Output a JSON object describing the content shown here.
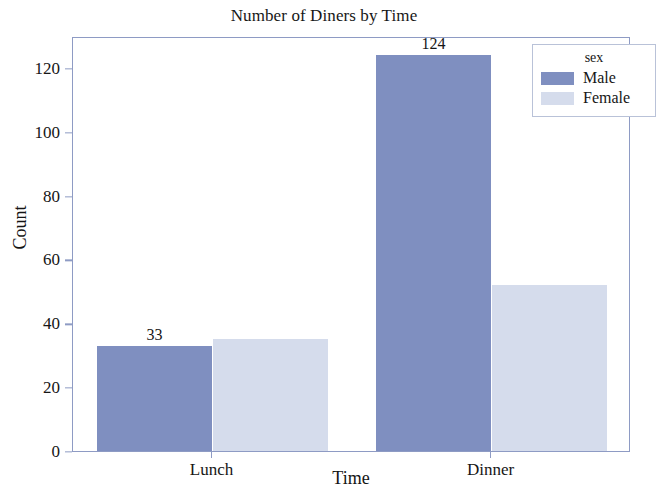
{
  "chart_data": {
    "type": "bar",
    "title": "Number of Diners by Time",
    "xlabel": "Time",
    "ylabel": "Count",
    "categories": [
      "Lunch",
      "Dinner"
    ],
    "series": [
      {
        "name": "Male",
        "color": "#7f8fc0",
        "values": [
          33,
          124
        ]
      },
      {
        "name": "Female",
        "color": "#d5dcec",
        "values": [
          35,
          52
        ]
      }
    ],
    "value_labels": [
      {
        "text": "33",
        "category": "Lunch",
        "series": "Male"
      },
      {
        "text": "124",
        "category": "Dinner",
        "series": "Male"
      }
    ],
    "ylim": [
      0,
      130
    ],
    "yticks": [
      0,
      20,
      40,
      60,
      80,
      100,
      120
    ],
    "ytick_labels": [
      "0",
      "20",
      "40",
      "60",
      "80",
      "100",
      "120"
    ],
    "xtick_labels": [
      "Lunch",
      "Dinner"
    ],
    "grid": false,
    "legend": {
      "title": "sex",
      "position": "upper right",
      "entries": [
        "Male",
        "Female"
      ]
    }
  },
  "legend": {
    "title": "sex",
    "entries": [
      {
        "label": "Male",
        "color": "#7f8fc0"
      },
      {
        "label": "Female",
        "color": "#d5dcec"
      }
    ]
  },
  "axes": {
    "y": {
      "label": "Count",
      "ticks": [
        {
          "label": "120",
          "value": 120
        },
        {
          "label": "100",
          "value": 100
        },
        {
          "label": "80",
          "value": 80
        },
        {
          "label": "60",
          "value": 60
        },
        {
          "label": "40",
          "value": 40
        },
        {
          "label": "20",
          "value": 20
        },
        {
          "label": "0",
          "value": 0
        }
      ]
    },
    "x": {
      "label": "Time",
      "ticks": [
        {
          "label": "Lunch"
        },
        {
          "label": "Dinner"
        }
      ]
    }
  },
  "title": "Number of Diners by Time"
}
